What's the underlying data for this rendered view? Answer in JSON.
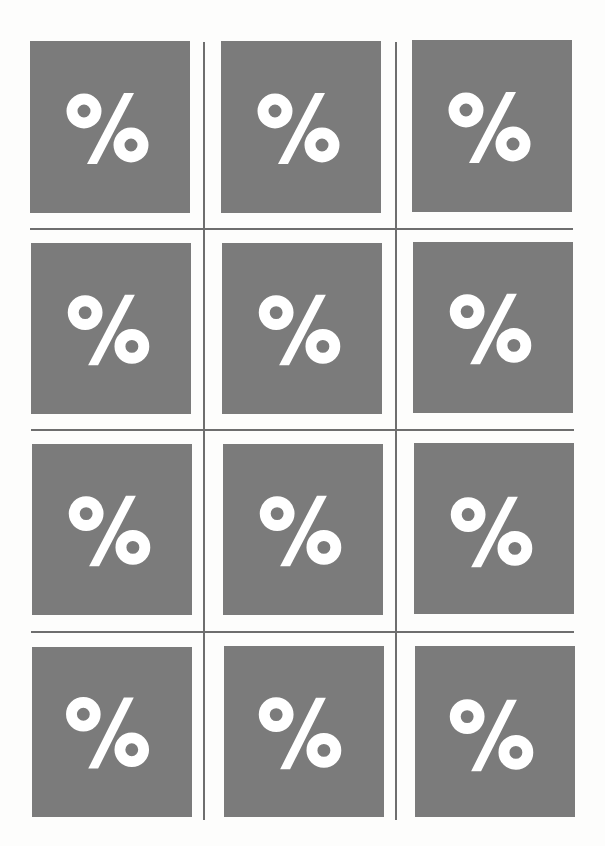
{
  "sheet": {
    "background": "#fdfdfc",
    "tile_color": "#7b7b7b",
    "glyph_color": "#ffffff",
    "line_color": "#6e6e6e",
    "rows": 4,
    "columns": 3
  },
  "tiles": [
    {
      "row": 1,
      "col": 1,
      "symbol": "%",
      "icon": "percent-icon"
    },
    {
      "row": 1,
      "col": 2,
      "symbol": "%",
      "icon": "percent-icon"
    },
    {
      "row": 1,
      "col": 3,
      "symbol": "%",
      "icon": "percent-icon"
    },
    {
      "row": 2,
      "col": 1,
      "symbol": "%",
      "icon": "percent-icon"
    },
    {
      "row": 2,
      "col": 2,
      "symbol": "%",
      "icon": "percent-icon"
    },
    {
      "row": 2,
      "col": 3,
      "symbol": "%",
      "icon": "percent-icon"
    },
    {
      "row": 3,
      "col": 1,
      "symbol": "%",
      "icon": "percent-icon"
    },
    {
      "row": 3,
      "col": 2,
      "symbol": "%",
      "icon": "percent-icon"
    },
    {
      "row": 3,
      "col": 3,
      "symbol": "%",
      "icon": "percent-icon"
    },
    {
      "row": 4,
      "col": 1,
      "symbol": "%",
      "icon": "percent-icon"
    },
    {
      "row": 4,
      "col": 2,
      "symbol": "%",
      "icon": "percent-icon"
    },
    {
      "row": 4,
      "col": 3,
      "symbol": "%",
      "icon": "percent-icon"
    }
  ]
}
